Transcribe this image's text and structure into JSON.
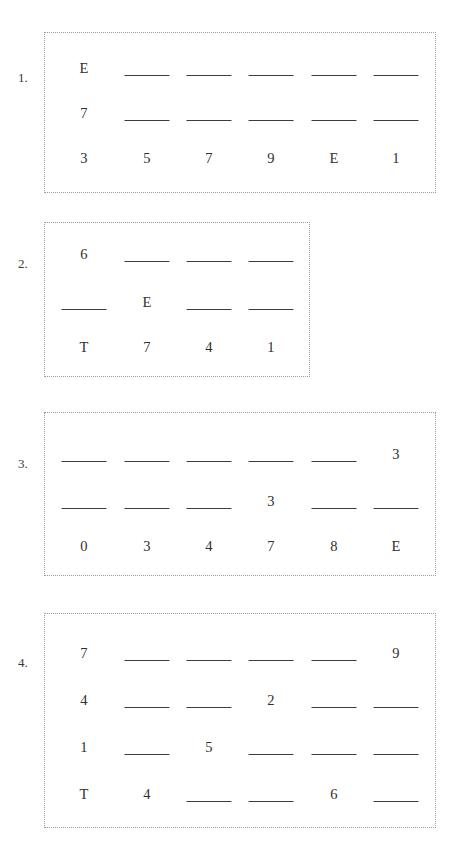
{
  "page": {
    "background_color": "#ffffff",
    "ink_color": "#2f2f2f",
    "frame_color": "#9a9a9a"
  },
  "problems": [
    {
      "label": "1.",
      "frame": {
        "x": 44,
        "y": 32,
        "w": 392,
        "h": 161
      },
      "columns": 6,
      "rows": [
        {
          "y": 62,
          "cells": [
            {
              "type": "digit",
              "value": "E"
            },
            {
              "type": "blank",
              "value": ""
            },
            {
              "type": "blank",
              "value": ""
            },
            {
              "type": "blank",
              "value": ""
            },
            {
              "type": "blank",
              "value": ""
            },
            {
              "type": "blank",
              "value": ""
            }
          ]
        },
        {
          "y": 107,
          "cells": [
            {
              "type": "digit",
              "value": "7"
            },
            {
              "type": "blank",
              "value": ""
            },
            {
              "type": "blank",
              "value": ""
            },
            {
              "type": "blank",
              "value": ""
            },
            {
              "type": "blank",
              "value": ""
            },
            {
              "type": "blank",
              "value": ""
            }
          ]
        },
        {
          "y": 152,
          "cells": [
            {
              "type": "digit",
              "value": "3"
            },
            {
              "type": "digit",
              "value": "5"
            },
            {
              "type": "digit",
              "value": "7"
            },
            {
              "type": "digit",
              "value": "9"
            },
            {
              "type": "digit",
              "value": "E"
            },
            {
              "type": "digit",
              "value": "1"
            }
          ]
        }
      ]
    },
    {
      "label": "2.",
      "frame": {
        "x": 44,
        "y": 222,
        "w": 266,
        "h": 155
      },
      "columns": 4,
      "rows": [
        {
          "y": 248,
          "cells": [
            {
              "type": "digit",
              "value": "6"
            },
            {
              "type": "blank",
              "value": ""
            },
            {
              "type": "blank",
              "value": ""
            },
            {
              "type": "blank",
              "value": ""
            }
          ]
        },
        {
          "y": 296,
          "cells": [
            {
              "type": "blank",
              "value": ""
            },
            {
              "type": "digit",
              "value": "E"
            },
            {
              "type": "blank",
              "value": ""
            },
            {
              "type": "blank",
              "value": ""
            }
          ]
        },
        {
          "y": 341,
          "cells": [
            {
              "type": "digit",
              "value": "T"
            },
            {
              "type": "digit",
              "value": "7"
            },
            {
              "type": "digit",
              "value": "4"
            },
            {
              "type": "digit",
              "value": "1"
            }
          ]
        }
      ]
    },
    {
      "label": "3.",
      "frame": {
        "x": 44,
        "y": 412,
        "w": 392,
        "h": 164
      },
      "columns": 6,
      "rows": [
        {
          "y": 448,
          "cells": [
            {
              "type": "blank",
              "value": ""
            },
            {
              "type": "blank",
              "value": ""
            },
            {
              "type": "blank",
              "value": ""
            },
            {
              "type": "blank",
              "value": ""
            },
            {
              "type": "blank",
              "value": ""
            },
            {
              "type": "digit",
              "value": "3"
            }
          ]
        },
        {
          "y": 495,
          "cells": [
            {
              "type": "blank",
              "value": ""
            },
            {
              "type": "blank",
              "value": ""
            },
            {
              "type": "blank",
              "value": ""
            },
            {
              "type": "digit",
              "value": "3"
            },
            {
              "type": "blank",
              "value": ""
            },
            {
              "type": "blank",
              "value": ""
            }
          ]
        },
        {
          "y": 540,
          "cells": [
            {
              "type": "digit",
              "value": "0"
            },
            {
              "type": "digit",
              "value": "3"
            },
            {
              "type": "digit",
              "value": "4"
            },
            {
              "type": "digit",
              "value": "7"
            },
            {
              "type": "digit",
              "value": "8"
            },
            {
              "type": "digit",
              "value": "E"
            }
          ]
        }
      ]
    },
    {
      "label": "4.",
      "frame": {
        "x": 44,
        "y": 613,
        "w": 392,
        "h": 215
      },
      "columns": 6,
      "rows": [
        {
          "y": 647,
          "cells": [
            {
              "type": "digit",
              "value": "7"
            },
            {
              "type": "blank",
              "value": ""
            },
            {
              "type": "blank",
              "value": ""
            },
            {
              "type": "blank",
              "value": ""
            },
            {
              "type": "blank",
              "value": ""
            },
            {
              "type": "digit",
              "value": "9"
            }
          ]
        },
        {
          "y": 694,
          "cells": [
            {
              "type": "digit",
              "value": "4"
            },
            {
              "type": "blank",
              "value": ""
            },
            {
              "type": "blank",
              "value": ""
            },
            {
              "type": "digit",
              "value": "2"
            },
            {
              "type": "blank",
              "value": ""
            },
            {
              "type": "blank",
              "value": ""
            }
          ]
        },
        {
          "y": 741,
          "cells": [
            {
              "type": "digit",
              "value": "1"
            },
            {
              "type": "blank",
              "value": ""
            },
            {
              "type": "digit",
              "value": "5"
            },
            {
              "type": "blank",
              "value": ""
            },
            {
              "type": "blank",
              "value": ""
            },
            {
              "type": "blank",
              "value": ""
            }
          ]
        },
        {
          "y": 788,
          "cells": [
            {
              "type": "digit",
              "value": "T"
            },
            {
              "type": "digit",
              "value": "4"
            },
            {
              "type": "blank",
              "value": ""
            },
            {
              "type": "blank",
              "value": ""
            },
            {
              "type": "digit",
              "value": "6"
            },
            {
              "type": "blank",
              "value": ""
            }
          ]
        }
      ]
    }
  ],
  "column_centers_6": [
    84,
    147,
    209,
    271,
    334,
    396
  ],
  "column_centers_4": [
    84,
    147,
    209,
    271
  ],
  "number_label_x": 18
}
